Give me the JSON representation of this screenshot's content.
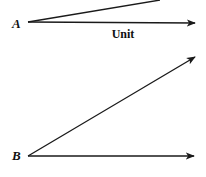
{
  "diagram": {
    "labels": {
      "point_a": "A",
      "point_b": "B",
      "unit": "Unit"
    },
    "figure_a": {
      "vertex": [
        28,
        22
      ],
      "unit_arrow_end": [
        195,
        23
      ],
      "angled_ray_end": [
        160,
        0
      ]
    },
    "figure_b": {
      "vertex": [
        28,
        156
      ],
      "horizontal_arrow_end": [
        194,
        156
      ],
      "angled_arrow_end": [
        195,
        57
      ]
    },
    "colors": {
      "line": "#1a1a1a",
      "background": "#ffffff"
    }
  }
}
